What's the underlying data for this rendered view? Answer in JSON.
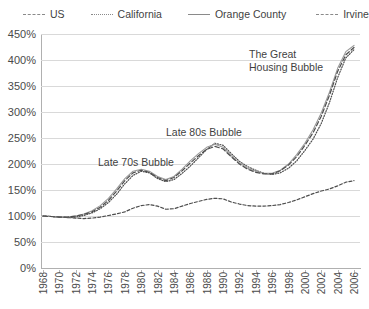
{
  "chart_data": {
    "type": "line",
    "title": "",
    "xlabel": "",
    "ylabel": "",
    "ylim": [
      0,
      450
    ],
    "ytick_step": 50,
    "ytick_labels": [
      "0%",
      "50%",
      "100%",
      "150%",
      "200%",
      "250%",
      "300%",
      "350%",
      "400%",
      "450%"
    ],
    "grid": true,
    "legend_position": "top",
    "x": [
      1968,
      1969,
      1970,
      1971,
      1972,
      1973,
      1974,
      1975,
      1976,
      1977,
      1978,
      1979,
      1980,
      1981,
      1982,
      1983,
      1984,
      1985,
      1986,
      1987,
      1988,
      1989,
      1990,
      1991,
      1992,
      1993,
      1994,
      1995,
      1996,
      1997,
      1998,
      1999,
      2000,
      2001,
      2002,
      2003,
      2004,
      2005,
      2006
    ],
    "xtick_labels": [
      "1968",
      "1970",
      "1972",
      "1974",
      "1976",
      "1978",
      "1980",
      "1982",
      "1984",
      "1986",
      "1988",
      "1990",
      "1992",
      "1994",
      "1996",
      "1998",
      "2000",
      "2002",
      "2004",
      "2006"
    ],
    "series": [
      {
        "name": "US",
        "style": "dashed",
        "color": "#4d4d4d",
        "values": [
          100,
          99,
          98,
          97,
          96,
          95,
          96,
          98,
          101,
          104,
          108,
          115,
          120,
          122,
          119,
          113,
          114,
          119,
          124,
          128,
          132,
          134,
          133,
          127,
          123,
          120,
          119,
          119,
          120,
          122,
          126,
          131,
          137,
          143,
          148,
          152,
          158,
          165,
          168
        ]
      },
      {
        "name": "California",
        "style": "dotted",
        "color": "#4d4d4d",
        "values": [
          100,
          99,
          98,
          97,
          98,
          101,
          106,
          114,
          126,
          142,
          162,
          178,
          186,
          183,
          172,
          166,
          170,
          182,
          196,
          212,
          228,
          240,
          236,
          220,
          205,
          195,
          188,
          182,
          180,
          183,
          192,
          206,
          226,
          248,
          278,
          318,
          366,
          404,
          420
        ]
      },
      {
        "name": "Orange County",
        "style": "solid",
        "color": "#9a9a9a",
        "values": [
          100,
          99,
          98,
          98,
          100,
          104,
          110,
          120,
          134,
          152,
          172,
          186,
          190,
          186,
          176,
          170,
          176,
          190,
          206,
          220,
          232,
          238,
          232,
          216,
          202,
          192,
          186,
          182,
          182,
          188,
          200,
          218,
          240,
          266,
          298,
          338,
          384,
          416,
          428
        ]
      },
      {
        "name": "Irvine",
        "style": "dashdash",
        "color": "#4d4d4d",
        "values": [
          100,
          99,
          98,
          98,
          100,
          103,
          108,
          117,
          130,
          148,
          168,
          183,
          188,
          184,
          174,
          168,
          174,
          187,
          202,
          216,
          228,
          234,
          229,
          214,
          200,
          190,
          184,
          181,
          181,
          187,
          198,
          214,
          236,
          260,
          292,
          332,
          378,
          410,
          424
        ]
      }
    ],
    "annotations": [
      {
        "id": "the-great-housing-bubble",
        "line1": "The Great",
        "line2": "Housing Bubble"
      },
      {
        "id": "late-80s-bubble",
        "text": "Late 80s Bubble"
      },
      {
        "id": "late-70s-bubble",
        "text": "Late 70s Bubble"
      }
    ]
  },
  "legend": {
    "items": [
      {
        "label": "US",
        "key": "k-us"
      },
      {
        "label": "California",
        "key": "k-ca"
      },
      {
        "label": "Orange County",
        "key": "k-oc"
      },
      {
        "label": "Irvine",
        "key": "k-ir"
      }
    ]
  }
}
